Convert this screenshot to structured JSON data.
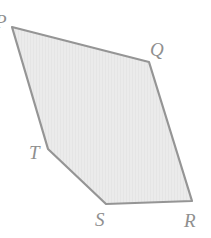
{
  "figure": {
    "name": "pentagon-pqrst",
    "canvas": {
      "width": 211,
      "height": 238,
      "background": "#ffffff"
    },
    "style": {
      "fill": "#ebebeb",
      "stroke": "#959595",
      "stroke_width": 2.2,
      "texture_stroke": "#e0e0e0",
      "label_color": "#8f8f8f"
    },
    "vertices": [
      {
        "label": "P",
        "x": 12,
        "y": 27
      },
      {
        "label": "Q",
        "x": 149,
        "y": 62
      },
      {
        "label": "R",
        "x": 192,
        "y": 201
      },
      {
        "label": "S",
        "x": 106,
        "y": 204
      },
      {
        "label": "T",
        "x": 48,
        "y": 149
      }
    ],
    "polygon_points": "12,27 149,62 192,201 106,204 48,149",
    "labels": {
      "p": "P",
      "q": "Q",
      "r": "R",
      "s": "S",
      "t": "T"
    }
  }
}
